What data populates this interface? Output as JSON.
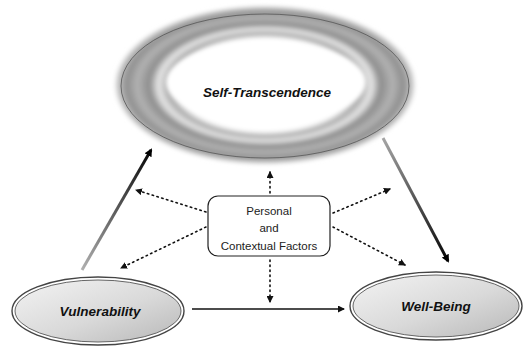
{
  "diagram": {
    "nodes": {
      "top": {
        "label": "Self-Transcendence"
      },
      "left": {
        "label": "Vulnerability"
      },
      "right": {
        "label": "Well-Being"
      },
      "center": {
        "lines": [
          "Personal",
          "and",
          "Contextual Factors"
        ]
      }
    },
    "edges": [
      {
        "from": "Vulnerability",
        "to": "Self-Transcendence",
        "style": "solid-gradient"
      },
      {
        "from": "Self-Transcendence",
        "to": "Well-Being",
        "style": "solid-gradient"
      },
      {
        "from": "Vulnerability",
        "to": "Well-Being",
        "style": "solid"
      },
      {
        "from": "Personal and Contextual Factors",
        "to": "Self-Transcendence",
        "style": "dotted"
      },
      {
        "from": "Personal and Contextual Factors",
        "to": "Vulnerability-to-Self-Transcendence path",
        "style": "dotted"
      },
      {
        "from": "Personal and Contextual Factors",
        "to": "Vulnerability",
        "style": "dotted"
      },
      {
        "from": "Personal and Contextual Factors",
        "to": "Self-Transcendence-to-Well-Being path",
        "style": "dotted"
      },
      {
        "from": "Personal and Contextual Factors",
        "to": "Well-Being",
        "style": "dotted"
      },
      {
        "from": "Personal and Contextual Factors",
        "to": "Vulnerability-to-Well-Being path",
        "style": "dotted"
      }
    ],
    "colors": {
      "ring_dark": "#8a8a8a",
      "ring_light": "#e6e6e6",
      "node_fill_light": "#f4f4f4",
      "node_fill_dark": "#bdbdbd",
      "stroke": "#333333",
      "arrow": "#111111"
    }
  }
}
